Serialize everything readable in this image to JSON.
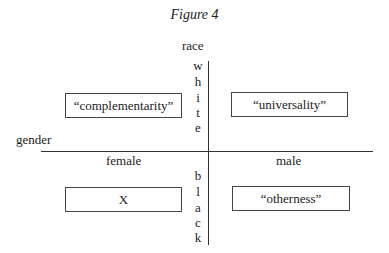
{
  "figure": {
    "title": "Figure 4",
    "vertical_axis": {
      "label": "race",
      "top_word": [
        "w",
        "h",
        "i",
        "t",
        "e"
      ],
      "bottom_word": [
        "b",
        "l",
        "a",
        "c",
        "k"
      ]
    },
    "horizontal_axis": {
      "label": "gender",
      "left": "female",
      "right": "male"
    },
    "quadrants": {
      "top_left": "“complementarity”",
      "top_right": "“universality”",
      "bottom_left": "X",
      "bottom_right": "“otherness”"
    }
  }
}
